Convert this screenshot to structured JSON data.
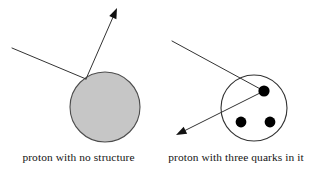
{
  "figure": {
    "type": "physics-scattering-diagram",
    "background_color": "#ffffff",
    "width": 315,
    "height": 169,
    "stroke_color": "#333333",
    "quark_color": "#000000",
    "proton_fill_color": "#c6c6c6",
    "proton_stroke_color": "#4d4d4d"
  },
  "panels": {
    "left": {
      "caption": "proton with no structure",
      "proton": {
        "label": "proton-solid-sphere",
        "cx": 105,
        "cy": 107,
        "r": 35,
        "fill": "#c6c6c6",
        "stroke": "#4d4d4d"
      },
      "incoming_ray": {
        "label": "incoming-particle-ray",
        "x1": 12,
        "y1": 48,
        "x2": 86,
        "y2": 79
      },
      "outgoing_ray": {
        "label": "scattered-particle-ray",
        "x1": 86,
        "y1": 79,
        "x2": 117,
        "y2": 8,
        "has_arrowhead": true
      }
    },
    "right": {
      "caption": "proton with three quarks in it",
      "proton": {
        "label": "proton-outline-circle",
        "cx": 254,
        "cy": 108,
        "r": 33,
        "fill": "none",
        "stroke": "#333333"
      },
      "quarks": [
        {
          "label": "quark-top",
          "cx": 264,
          "cy": 91,
          "r": 5.6
        },
        {
          "label": "quark-bottom-left",
          "cx": 241,
          "cy": 122,
          "r": 5.4
        },
        {
          "label": "quark-bottom-right",
          "cx": 270,
          "cy": 122,
          "r": 5.4
        }
      ],
      "incoming_ray": {
        "label": "incoming-particle-ray",
        "x1": 172,
        "y1": 41,
        "x2": 264,
        "y2": 91
      },
      "outgoing_ray": {
        "label": "scattered-particle-ray",
        "x1": 264,
        "y1": 91,
        "x2": 176,
        "y2": 135,
        "has_arrowhead": true
      }
    }
  }
}
